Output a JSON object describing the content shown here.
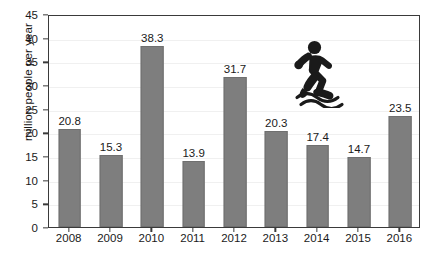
{
  "chart_data": {
    "type": "bar",
    "title": "",
    "subtitle": "",
    "xlabel": "",
    "ylabel": "million people per year",
    "categories": [
      "2008",
      "2009",
      "2010",
      "2011",
      "2012",
      "2013",
      "2014",
      "2015",
      "2016"
    ],
    "values": [
      20.8,
      15.3,
      38.3,
      13.9,
      31.7,
      20.3,
      17.4,
      14.7,
      23.5
    ],
    "value_labels": [
      "20.8",
      "15.3",
      "38.3",
      "13.9",
      "31.7",
      "20.3",
      "17.4",
      "14.7",
      "23.5"
    ],
    "ylim": [
      0,
      45
    ],
    "ytick_values": [
      0,
      5,
      10,
      15,
      20,
      25,
      30,
      35,
      40,
      45
    ],
    "ytick_labels": [
      "0",
      "5",
      "10",
      "15",
      "20",
      "25",
      "30",
      "35",
      "40",
      "45"
    ],
    "grid": true,
    "legend": "none",
    "series": [
      {
        "name": "million people per year",
        "values": [
          20.8,
          15.3,
          38.3,
          13.9,
          31.7,
          20.3,
          17.4,
          14.7,
          23.5
        ]
      }
    ],
    "colors": {
      "bar_fill": "#7e7e7e",
      "bar_edge": "#6f6f6f",
      "axis": "#3a3a3a",
      "text": "#1a1a1a",
      "background": "#ffffff",
      "gridline": "#f0f0f0",
      "pictogram": "#1a1a1a"
    },
    "annotations": [
      {
        "name": "running-person-over-waves-pictogram",
        "description": "person running above wavy water lines",
        "x_category": "2014",
        "value_top": 42
      }
    ]
  }
}
